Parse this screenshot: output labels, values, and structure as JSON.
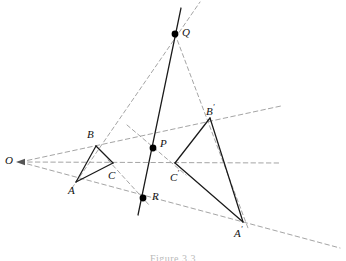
{
  "figure": {
    "caption": "Figure 3.3",
    "background_color": "#ffffff",
    "solid_line_color": "#1a1a1a",
    "dashed_line_color": "#9a9a9a",
    "point_color": "#000000",
    "label_color": "#111111"
  },
  "labels": {
    "O": "O",
    "A": "A",
    "B": "B",
    "C": "C",
    "A_prime_base": "A",
    "B_prime_base": "B",
    "C_prime_base": "C",
    "prime_mark": "′",
    "P": "P",
    "Q": "Q",
    "R": "R"
  },
  "chart_data": {
    "type": "diagram",
    "coordinate_space": {
      "width": 346,
      "height": 261
    },
    "points": [
      {
        "name": "O",
        "label": "O",
        "x": 20,
        "y": 162,
        "marked": false,
        "label_x": 5,
        "label_y": 155
      },
      {
        "name": "A",
        "label": "A",
        "x": 76,
        "y": 182,
        "marked": false,
        "label_x": 68,
        "label_y": 185
      },
      {
        "name": "B",
        "label": "B",
        "x": 96,
        "y": 146,
        "marked": false,
        "label_x": 87,
        "label_y": 129
      },
      {
        "name": "C",
        "label": "C",
        "x": 113,
        "y": 163,
        "marked": false,
        "label_x": 108,
        "label_y": 170
      },
      {
        "name": "A'",
        "label": "A′",
        "x": 243,
        "y": 222,
        "marked": false,
        "label_x": 234,
        "label_y": 226
      },
      {
        "name": "B'",
        "label": "B′",
        "x": 210,
        "y": 118,
        "marked": false,
        "label_x": 206,
        "label_y": 104
      },
      {
        "name": "C'",
        "label": "C′",
        "x": 175,
        "y": 163,
        "marked": false,
        "label_x": 170,
        "label_y": 170
      },
      {
        "name": "P",
        "label": "P",
        "x": 153,
        "y": 148,
        "marked": true,
        "label_x": 160,
        "label_y": 138
      },
      {
        "name": "Q",
        "label": "Q",
        "x": 175,
        "y": 34,
        "marked": true,
        "label_x": 182,
        "label_y": 27
      },
      {
        "name": "R",
        "label": "R",
        "x": 143,
        "y": 198,
        "marked": true,
        "label_x": 152,
        "label_y": 191
      }
    ],
    "solid_segments": [
      {
        "name": "triangle-ABC-side-AB",
        "from": "A",
        "to": "B"
      },
      {
        "name": "triangle-ABC-side-BC",
        "from": "B",
        "to": "C"
      },
      {
        "name": "triangle-ABC-side-CA",
        "from": "C",
        "to": "A"
      },
      {
        "name": "triangle-A'B'C'-side-A'B'",
        "from": "A'",
        "to": "B'"
      },
      {
        "name": "triangle-A'B'C'-side-B'C'",
        "from": "B'",
        "to": "C'"
      },
      {
        "name": "triangle-A'B'C'-side-C'A'",
        "from": "C'",
        "to": "A'"
      }
    ],
    "solid_lines": [
      {
        "name": "axis-line-PQR",
        "x1": 181,
        "y1": 8,
        "x2": 138,
        "y2": 215
      }
    ],
    "dashed_rays_from_O": [
      {
        "name": "perspective-ray-O-A-A'",
        "x1": 20,
        "y1": 162,
        "x2": 340,
        "y2": 248
      },
      {
        "name": "perspective-ray-O-B-B'",
        "x1": 20,
        "y1": 162,
        "x2": 281,
        "y2": 106
      },
      {
        "name": "perspective-ray-O-C-C'",
        "x1": 20,
        "y1": 162,
        "x2": 281,
        "y2": 163
      }
    ],
    "dashed_extension_lines": [
      {
        "name": "extension-AB-to-Q",
        "x1": 72,
        "y1": 188,
        "x2": 200,
        "y2": 2
      },
      {
        "name": "extension-A'B'-to-Q",
        "x1": 175,
        "y1": 34,
        "x2": 248,
        "y2": 228
      },
      {
        "name": "extension-BC-to-P-C'",
        "x1": 127,
        "y1": 125,
        "x2": 186,
        "y2": 175
      },
      {
        "name": "extension-CA-to-R",
        "x1": 108,
        "y1": 160,
        "x2": 150,
        "y2": 206
      }
    ],
    "annotations": {
      "center_of_perspectivity": "O",
      "axis_of_perspectivity_points": [
        "P",
        "Q",
        "R"
      ]
    }
  }
}
